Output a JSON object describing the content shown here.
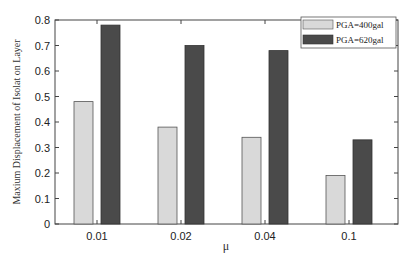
{
  "chart_data": {
    "type": "bar",
    "title": "",
    "xlabel": "μ",
    "ylabel": "Maxium Displacement of Isolat on Layer",
    "categories": [
      "0.01",
      "0.02",
      "0.04",
      "0.1"
    ],
    "series": [
      {
        "name": "PGA=400gal",
        "values": [
          0.48,
          0.38,
          0.34,
          0.19
        ],
        "color": "#d9d9d9"
      },
      {
        "name": "PGA=620gal",
        "values": [
          0.78,
          0.7,
          0.68,
          0.33
        ],
        "color": "#4a4a4a"
      }
    ],
    "ylim": [
      0,
      0.8
    ],
    "yticks": [
      "0",
      "0.1",
      "0.2",
      "0.3",
      "0.4",
      "0.5",
      "0.6",
      "0.7",
      "0.8"
    ],
    "grid": false,
    "legend_position": "upper right"
  }
}
